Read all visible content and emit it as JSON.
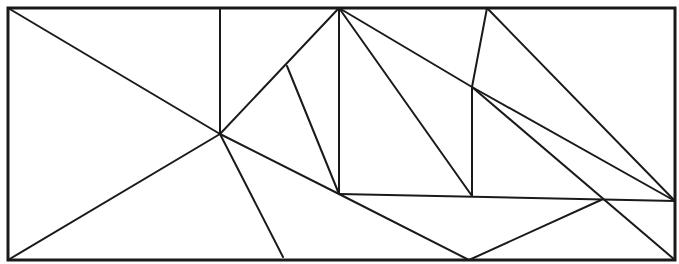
{
  "diagram": {
    "type": "line-partition-figure",
    "canvas": {
      "width": 679,
      "height": 264,
      "background": "#ffffff"
    },
    "stroke_color": "#1a1a1a",
    "frame": {
      "x": 8,
      "y": 8,
      "width": 667,
      "height": 252,
      "stroke_width": 3
    },
    "vertices": {
      "TL": [
        8,
        8
      ],
      "TR": [
        675,
        8
      ],
      "BL": [
        8,
        260
      ],
      "BR": [
        675,
        260
      ],
      "C": [
        220,
        134
      ],
      "T1": [
        220,
        8
      ],
      "T2": [
        339,
        8
      ],
      "T3": [
        487,
        8
      ],
      "P": [
        287,
        66
      ],
      "Q": [
        339,
        194
      ],
      "R": [
        472,
        87
      ],
      "S": [
        472,
        196
      ],
      "E": [
        675,
        201
      ],
      "F": [
        601,
        200
      ],
      "B1": [
        469,
        260
      ],
      "B2": [
        283,
        257
      ]
    },
    "segments": [
      {
        "from": "TL",
        "to": "C"
      },
      {
        "from": "T1",
        "to": "C"
      },
      {
        "from": "BL",
        "to": "C"
      },
      {
        "from": "C",
        "to": "T2"
      },
      {
        "from": "P",
        "to": "Q"
      },
      {
        "from": "C",
        "to": "B2"
      },
      {
        "from": "C",
        "to": "Q"
      },
      {
        "from": "Q",
        "to": "B1"
      },
      {
        "from": "T2",
        "to": "Q"
      },
      {
        "from": "T2",
        "to": "S"
      },
      {
        "from": "T2",
        "to": "R"
      },
      {
        "from": "R",
        "to": "E"
      },
      {
        "from": "T3",
        "to": "R"
      },
      {
        "from": "T3",
        "to": "E"
      },
      {
        "from": "R",
        "to": "S"
      },
      {
        "from": "R",
        "to": "BR"
      },
      {
        "from": "Q",
        "to": "E"
      },
      {
        "from": "B1",
        "to": "F"
      }
    ]
  }
}
